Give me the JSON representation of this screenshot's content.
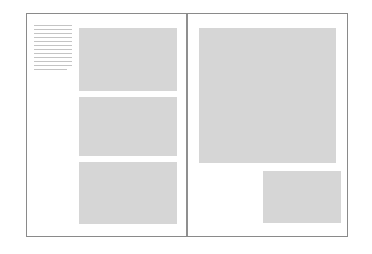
{
  "document": {
    "type": "two-page-spread-layout-wireframe",
    "background_color": "#ffffff",
    "border_color": "#8a8a8a",
    "gutter_color": "#8f8f8f",
    "placeholder_color": "#d6d6d6",
    "rule_color": "#c4c4c4"
  },
  "spread": {
    "left_page": {
      "label": "Left page",
      "text_column": {
        "label": "Text column",
        "line_count": 12,
        "lines": [
          {
            "width": "full"
          },
          {
            "width": "full"
          },
          {
            "width": "full"
          },
          {
            "width": "full"
          },
          {
            "width": "full"
          },
          {
            "width": "full"
          },
          {
            "width": "full"
          },
          {
            "width": "full"
          },
          {
            "width": "full"
          },
          {
            "width": "full"
          },
          {
            "width": "full"
          },
          {
            "width": "short"
          }
        ]
      },
      "images": [
        {
          "label": "Image placeholder 1",
          "aspect": "landscape"
        },
        {
          "label": "Image placeholder 2",
          "aspect": "landscape"
        },
        {
          "label": "Image placeholder 3",
          "aspect": "landscape"
        }
      ]
    },
    "right_page": {
      "label": "Right page",
      "images": [
        {
          "label": "Large image placeholder",
          "aspect": "square"
        },
        {
          "label": "Small image placeholder",
          "aspect": "landscape"
        }
      ]
    }
  }
}
